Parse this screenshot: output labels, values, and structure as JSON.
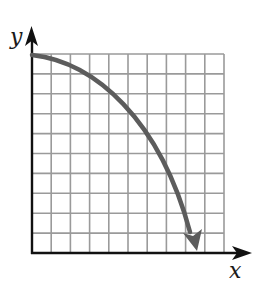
{
  "diagram": {
    "type": "coordinate-graph",
    "axes": {
      "x_label": "x",
      "y_label": "y",
      "origin_px": [
        32,
        253
      ],
      "x_axis_end_px": 251,
      "y_axis_end_px": 27
    },
    "grid": {
      "columns": 10,
      "rows": 10,
      "left_px": 32,
      "right_px": 224,
      "top_px": 54,
      "bottom_px": 253,
      "line_color": "#9a9a9a"
    },
    "curve": {
      "description": "Concave-down decreasing curve starting on the y-axis at the top of the grid and descending steeply toward the x-axis, ending in an arrowhead",
      "color": "#5c5c5c",
      "start_grid": [
        0,
        10
      ],
      "end_grid": [
        8.6,
        0.15
      ],
      "sample_points_grid": [
        [
          0,
          10
        ],
        [
          3,
          8.9
        ],
        [
          4.95,
          6.9
        ],
        [
          6.7,
          4.7
        ],
        [
          8.1,
          1.5
        ],
        [
          8.6,
          0.15
        ]
      ],
      "has_arrowhead": true
    },
    "colors": {
      "axis": "#111111",
      "grid": "#9a9a9a",
      "curve": "#5c5c5c",
      "background": "#ffffff"
    }
  }
}
